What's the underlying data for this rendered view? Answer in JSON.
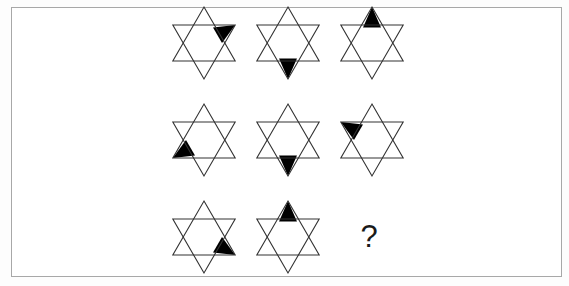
{
  "page": {
    "background_color": "#ffffff",
    "frame_color": "#a8a8a8",
    "stroke_color": "#333333",
    "fill_color": "#000000"
  },
  "puzzle": {
    "type": "matrix-reasoning",
    "rows": 3,
    "columns": 3,
    "shape": "hexagram",
    "point_names": [
      "top",
      "upper-right",
      "lower-right",
      "bottom",
      "lower-left",
      "upper-left"
    ],
    "missing_label": "?",
    "cells": [
      {
        "row": 1,
        "col": 1,
        "name": "star-1",
        "kind": "star",
        "filled_point": "upper-right",
        "cx": 204,
        "cy": 43
      },
      {
        "row": 1,
        "col": 2,
        "name": "star-2",
        "kind": "star",
        "filled_point": "bottom",
        "cx": 288,
        "cy": 43
      },
      {
        "row": 1,
        "col": 3,
        "name": "star-3",
        "kind": "star",
        "filled_point": "top",
        "cx": 372,
        "cy": 43
      },
      {
        "row": 2,
        "col": 1,
        "name": "star-4",
        "kind": "star",
        "filled_point": "lower-left",
        "cx": 204,
        "cy": 140
      },
      {
        "row": 2,
        "col": 2,
        "name": "star-5",
        "kind": "star",
        "filled_point": "bottom",
        "cx": 288,
        "cy": 140
      },
      {
        "row": 2,
        "col": 3,
        "name": "star-6",
        "kind": "star",
        "filled_point": "upper-left",
        "cx": 372,
        "cy": 140
      },
      {
        "row": 3,
        "col": 1,
        "name": "star-7",
        "kind": "star",
        "filled_point": "lower-right",
        "cx": 204,
        "cy": 237
      },
      {
        "row": 3,
        "col": 2,
        "name": "star-8",
        "kind": "star",
        "filled_point": "top",
        "cx": 288,
        "cy": 237
      },
      {
        "row": 3,
        "col": 3,
        "name": "answer-placeholder",
        "kind": "question",
        "filled_point": null,
        "cx": 369,
        "cy": 236
      }
    ]
  }
}
